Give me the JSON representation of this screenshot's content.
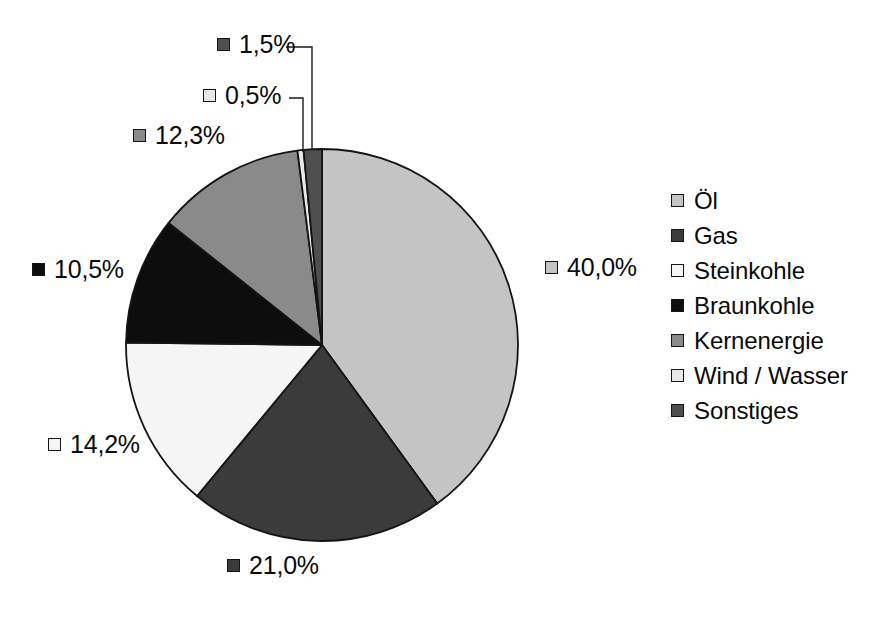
{
  "chart_data": {
    "type": "pie",
    "title": "",
    "subtitle": "",
    "xlabel": "",
    "ylabel": "",
    "grid": false,
    "legend_position": "right",
    "value_suffix": "%",
    "decimal_separator": ",",
    "start_angle_deg": 0,
    "direction": "clockwise",
    "categories": [
      "Öl",
      "Gas",
      "Steinkohle",
      "Braunkohle",
      "Kernenergie",
      "Wind / Wasser",
      "Sonstiges"
    ],
    "values": [
      40.0,
      21.0,
      14.2,
      10.5,
      12.3,
      0.5,
      1.5
    ],
    "value_labels": [
      "40,0%",
      "21,0%",
      "14,2%",
      "10,5%",
      "12,3%",
      "0,5%",
      "1,5%"
    ],
    "colors": [
      "#c4c4c4",
      "#3b3b3b",
      "#f5f5f5",
      "#0d0d0d",
      "#8a8a8a",
      "#e8e8e8",
      "#4f4f4f"
    ],
    "slice_border_color": "#141414",
    "total": 100.0
  },
  "pie": {
    "center_x": 322,
    "center_y": 345,
    "radius": 196,
    "slices": [
      {
        "name": "Öl",
        "value_label": "40,0%",
        "color": "#c4c4c4",
        "start_deg": 0,
        "sweep_deg": 144.0,
        "label_x": 545,
        "label_y": 255
      },
      {
        "name": "Gas",
        "value_label": "21,0%",
        "color": "#3b3b3b",
        "start_deg": 144.0,
        "sweep_deg": 75.6,
        "label_x": 227,
        "label_y": 553
      },
      {
        "name": "Steinkohle",
        "value_label": "14,2%",
        "color": "#f5f5f5",
        "start_deg": 219.6,
        "sweep_deg": 51.12,
        "label_x": 48,
        "label_y": 432
      },
      {
        "name": "Braunkohle",
        "value_label": "10,5%",
        "color": "#0d0d0d",
        "start_deg": 270.72,
        "sweep_deg": 37.8,
        "label_x": 32,
        "label_y": 257
      },
      {
        "name": "Kernenergie",
        "value_label": "12,3%",
        "color": "#8a8a8a",
        "start_deg": 308.52,
        "sweep_deg": 44.28,
        "label_x": 133,
        "label_y": 123
      },
      {
        "name": "Wind / Wasser",
        "value_label": "0,5%",
        "color": "#e8e8e8",
        "start_deg": 352.8,
        "sweep_deg": 1.8,
        "label_x": 203,
        "label_y": 83
      },
      {
        "name": "Sonstiges",
        "value_label": "1,5%",
        "color": "#4f4f4f",
        "start_deg": 354.6,
        "sweep_deg": 5.4,
        "label_x": 217,
        "label_y": 32
      }
    ],
    "leader_lines": [
      {
        "name": "leader-line-sonstiges",
        "points": "286,47 312,47 312,150"
      },
      {
        "name": "leader-line-wind-wasser",
        "points": "289,98 303,98 303,152"
      }
    ]
  },
  "legend": {
    "items": [
      {
        "label": "Öl",
        "color": "#c4c4c4"
      },
      {
        "label": "Gas",
        "color": "#3b3b3b"
      },
      {
        "label": "Steinkohle",
        "color": "#f5f5f5"
      },
      {
        "label": "Braunkohle",
        "color": "#0d0d0d"
      },
      {
        "label": "Kernenergie",
        "color": "#8a8a8a"
      },
      {
        "label": "Wind / Wasser",
        "color": "#e8e8e8"
      },
      {
        "label": "Sonstiges",
        "color": "#4f4f4f"
      }
    ]
  }
}
